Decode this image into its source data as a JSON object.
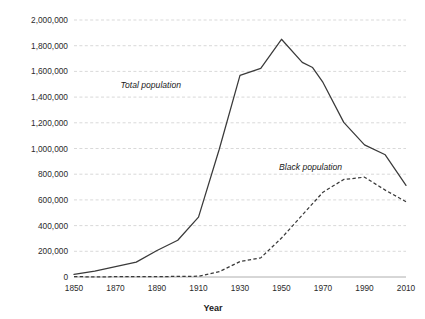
{
  "chart_data": {
    "type": "line",
    "title": "",
    "subtitle": "",
    "xlabel": "Year",
    "ylabel": "",
    "xlim": [
      1850,
      2010
    ],
    "ylim": [
      0,
      2000000
    ],
    "grid": true,
    "grid_axis": "y",
    "legend": "inline-annotations",
    "legend_position": "inline",
    "x_ticks": [
      1850,
      1870,
      1890,
      1910,
      1930,
      1950,
      1970,
      1990,
      2010
    ],
    "x_tick_labels": [
      "1850",
      "1870",
      "1890",
      "1910",
      "1930",
      "1950",
      "1970",
      "1990",
      "2010"
    ],
    "y_ticks": [
      0,
      200000,
      400000,
      600000,
      800000,
      1000000,
      1200000,
      1400000,
      1600000,
      1800000,
      2000000
    ],
    "y_tick_labels": [
      "0",
      "200,000",
      "400,000",
      "600,000",
      "800,000",
      "1,000,000",
      "1,200,000",
      "1,400,000",
      "1,600,000",
      "1,800,000",
      "2,000,000"
    ],
    "series": [
      {
        "name": "Total population",
        "style": "solid",
        "color": "#3a3a3a",
        "annotation": "Total population",
        "x": [
          1850,
          1860,
          1870,
          1880,
          1890,
          1900,
          1910,
          1920,
          1930,
          1940,
          1950,
          1960,
          1965,
          1970,
          1980,
          1990,
          2000,
          2010
        ],
        "values": [
          21000,
          45000,
          80000,
          116000,
          206000,
          286000,
          466000,
          994000,
          1569000,
          1623000,
          1850000,
          1670000,
          1630000,
          1514000,
          1203000,
          1028000,
          951000,
          713000
        ]
      },
      {
        "name": "Black population",
        "style": "dashed",
        "color": "#3a3a3a",
        "annotation": "Black population",
        "x": [
          1850,
          1860,
          1870,
          1880,
          1890,
          1900,
          1910,
          1920,
          1930,
          1940,
          1950,
          1960,
          1970,
          1980,
          1990,
          2000,
          2010
        ],
        "values": [
          2600,
          1400,
          2200,
          2800,
          3400,
          4100,
          6000,
          41000,
          120000,
          149000,
          303000,
          482000,
          660000,
          759000,
          777000,
          676000,
          586000
        ]
      }
    ],
    "annotations": [
      {
        "text": "Total population",
        "x": 1887,
        "y": 1470000
      },
      {
        "text": "Black population",
        "x": 1964,
        "y": 830000
      }
    ]
  }
}
